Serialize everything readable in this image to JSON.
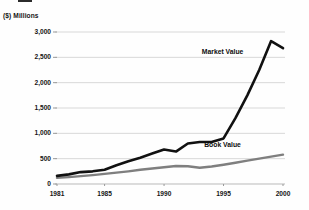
{
  "chart_data": {
    "type": "line",
    "title": "",
    "unit_label": "($) Millions",
    "xlabel": "",
    "ylabel": "($) Millions",
    "x": [
      1981,
      1982,
      1983,
      1984,
      1985,
      1986,
      1987,
      1988,
      1989,
      1990,
      1991,
      1992,
      1993,
      1994,
      1995,
      1996,
      1997,
      1998,
      1999,
      2000
    ],
    "xlim": [
      1981,
      2000
    ],
    "ylim": [
      0,
      3000
    ],
    "ytick_labels": [
      "3,000",
      "2,500",
      "2,000",
      "1,500",
      "1,000",
      "500",
      "0"
    ],
    "ytick_values": [
      3000,
      2500,
      2000,
      1500,
      1000,
      500,
      0
    ],
    "xtick_labels": [
      "1981",
      "1985",
      "1990",
      "1995",
      "2000"
    ],
    "xtick_values": [
      1981,
      1985,
      1990,
      1995,
      2000
    ],
    "grid": true,
    "grid_axis": "y",
    "legend_position": "inline-annotation",
    "series": [
      {
        "name": "Market Value",
        "color": "#111111",
        "line_width": 2.6,
        "values": [
          160,
          190,
          235,
          250,
          280,
          370,
          450,
          520,
          600,
          680,
          640,
          800,
          830,
          830,
          900,
          1300,
          1750,
          2250,
          2820,
          2680
        ]
      },
      {
        "name": "Book Value",
        "color": "#7f7f7f",
        "line_width": 2.4,
        "values": [
          120,
          135,
          155,
          175,
          200,
          225,
          250,
          280,
          305,
          330,
          355,
          350,
          320,
          345,
          380,
          420,
          460,
          500,
          540,
          580
        ]
      }
    ],
    "annotations": [
      {
        "text": "Market Value",
        "x": 1996.2,
        "y": 2600
      },
      {
        "text": "Book Value",
        "x": 1996.4,
        "y": 760
      }
    ]
  }
}
